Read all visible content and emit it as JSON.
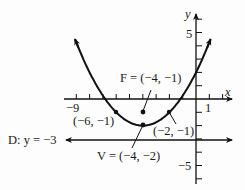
{
  "chart_data": {
    "type": "line",
    "title": "",
    "equation": "(x + 4)^2 = 4(y + 2)",
    "xlabel": "x",
    "ylabel": "y",
    "xlim": [
      -9.5,
      2.5
    ],
    "ylim": [
      -6,
      6.5
    ],
    "x_tick_labels": [
      {
        "value": -9,
        "label": "−9"
      },
      {
        "value": 1,
        "label": "1"
      }
    ],
    "y_tick_labels": [
      {
        "value": 5,
        "label": "5"
      },
      {
        "value": -5,
        "label": "−5"
      }
    ],
    "grid": false,
    "series": [
      {
        "name": "parabola",
        "vertex": [
          -4,
          -2
        ],
        "a": 0.25,
        "x_range": [
          -9.1,
          1.1
        ]
      },
      {
        "name": "directrix",
        "y": -3
      }
    ],
    "points": [
      {
        "name": "focus",
        "x": -4,
        "y": -1,
        "label": "F = (−4, −1)"
      },
      {
        "name": "vertex",
        "x": -4,
        "y": -2,
        "label": "V = (−4, −2)"
      },
      {
        "name": "latus-left",
        "x": -6,
        "y": -1,
        "label": "(−6, −1)"
      },
      {
        "name": "latus-right",
        "x": -2,
        "y": -1,
        "label": "(−2, −1)"
      }
    ],
    "annotations": {
      "directrix_label": "D: y = −3"
    }
  },
  "labels": {
    "x_axis": "x",
    "y_axis": "y",
    "x_min": "−9",
    "x_one": "1",
    "y_five": "5",
    "y_neg_five": "−5",
    "focus": "F = (−4, −1)",
    "vertex": "V = (−4, −2)",
    "left_point": "(−6, −1)",
    "right_point": "(−2, −1)",
    "directrix": "D: y = −3"
  }
}
